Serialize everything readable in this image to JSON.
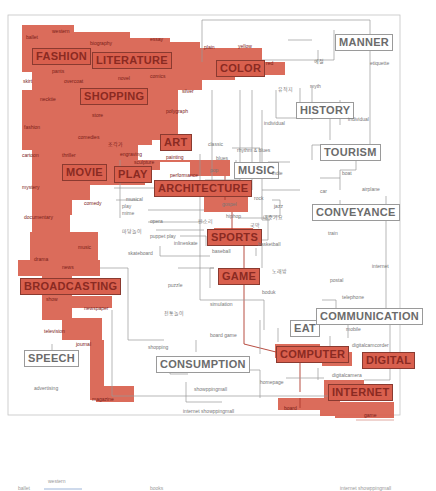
{
  "colors": {
    "highlight": "#d9604e",
    "highlight_border": "#8a3a30",
    "line": "#9a9a9a",
    "hot_line": "#b03a2e",
    "text": "#6b6b6b"
  },
  "categories": {
    "fashion": "FASHION",
    "literature": "LITERATURE",
    "color": "COLOR",
    "manner": "MANNER",
    "shopping": "SHOPPING",
    "history": "HISTORY",
    "art": "ART",
    "tourism": "TOURISM",
    "movie": "MOVIE",
    "play": "PLAY",
    "music": "MUSIC",
    "architecture": "ARCHITECTURE",
    "conveyance": "CONVEYANCE",
    "sports": "SPORTS",
    "game": "GAME",
    "broadcasting": "BROADCASTING",
    "eat": "EAT",
    "communication": "COMMUNICATION",
    "speech": "SPEECH",
    "consumption": "CONSUMPTION",
    "computer": "COMPUTER",
    "digital": "DIGITAL",
    "internet": "INTERNET"
  },
  "leaves": {
    "ballet": "ballet",
    "western": "western",
    "biography": "biography",
    "essay": "essay",
    "plain": "plain",
    "yellow": "yellow",
    "red": "red",
    "pants": "pants",
    "overcoat": "overcoat",
    "novel": "novel",
    "comics": "comics",
    "skirt": "skirt",
    "necktie": "necktie",
    "silver": "silver",
    "store": "store",
    "polygraph": "polygraph",
    "fashion": "fashion",
    "comedies": "comedies",
    "korean_a": "조각가",
    "engraving": "engraving",
    "sculpture": "sculpture",
    "painting": "painting",
    "cartoon": "cartoon",
    "thriller": "thriller",
    "classic": "classic",
    "rhythm_blues": "rhythm & blues",
    "blues": "blues",
    "pop": "pop",
    "performance": "performance",
    "indie": "indie",
    "mystery": "mystery",
    "comedy": "comedy",
    "musical": "musical",
    "play": "play",
    "mime": "mime",
    "documentary": "documentary",
    "opera": "opera",
    "korean_b": "판소리",
    "gospel": "gospel",
    "rock": "rock",
    "hiphop": "hiphop",
    "jazz": "jazz",
    "korean_c": "대중가요",
    "korean_d": "국악",
    "korean_e": "마당놀이",
    "puppet_play": "puppet play",
    "inlineskate": "inlineskate",
    "skateboard": "skateboard",
    "baseball": "baseball",
    "basketball": "basketball",
    "drama": "drama",
    "music": "music",
    "news": "news",
    "puzzle": "puzzle",
    "korean_f": "노래방",
    "boduk": "boduk",
    "show": "show",
    "newspaper": "newspaper",
    "simulation": "simulation",
    "korean_g": "전통놀이",
    "television": "television",
    "journal": "journal",
    "board_game": "board game",
    "shopping": "shopping",
    "homepage": "homepage",
    "advertising": "advertising",
    "showppingmall": "showppingmall",
    "internet_showppingmall": "internet showppingmall",
    "magazine": "magazine",
    "board": "board",
    "game": "game",
    "korean_h": "예절",
    "etiquette": "etiquette",
    "korean_i": "유적지",
    "myth": "myth",
    "individual_a": "individual",
    "individual_b": "individual",
    "boat": "boat",
    "car": "car",
    "airplane": "airplane",
    "train": "train",
    "internet": "internet",
    "postal": "postal",
    "telephone": "telephone",
    "mobile": "mobile",
    "digitalcamcorder": "digitalcamcorder",
    "digitalcamera": "digitalcamera"
  },
  "legend": {
    "label_a": "ballet",
    "label_b": "western",
    "label_c": "books",
    "label_d": "internet showppingmall"
  }
}
